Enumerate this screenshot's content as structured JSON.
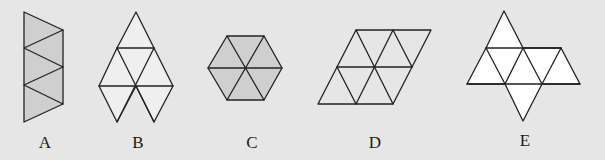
{
  "colors": {
    "background": "#e6e6e6",
    "line": "#222222",
    "fill_a": "#cfcfcf",
    "fill_b": "#efefef",
    "fill_c": "#cfcfcf",
    "fill_d": "#e6e6e6",
    "fill_e": "#ffffff"
  },
  "figures": [
    {
      "id": "A",
      "label": "A",
      "description": "Vertical strip of 5 triangles (trapezoid-like), gray fill"
    },
    {
      "id": "B",
      "label": "B",
      "description": "Figure of 7 triangles: one on top, row of 3 then 2 pairs below, light fill"
    },
    {
      "id": "C",
      "label": "C",
      "description": "Regular hexagon of 6 triangles, gray fill"
    },
    {
      "id": "D",
      "label": "D",
      "description": "Parallelogram of 8 triangles, no fill"
    },
    {
      "id": "E",
      "label": "E",
      "description": "Net of 8 triangles: one on top, row of 5, one at bottom, white fill"
    }
  ]
}
